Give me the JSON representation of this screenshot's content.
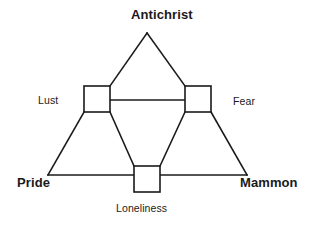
{
  "diagram": {
    "title_text": "Antichrist",
    "type": "triangle-node-diagram",
    "stroke_color": "#1a1a1a",
    "fill_color": "#ffffff",
    "background_color": "#ffffff",
    "vertex_labels": {
      "top": "Antichrist",
      "bottom_left": "Pride",
      "bottom_right": "Mammon"
    },
    "node_labels": {
      "left": "Lust",
      "right": "Fear",
      "bottom": "Loneliness"
    },
    "labels": [
      {
        "id": "antichrist",
        "text": "Antichrist",
        "weight": "bold",
        "position": "top-vertex"
      },
      {
        "id": "lust",
        "text": "Lust",
        "weight": "regular",
        "position": "left-node"
      },
      {
        "id": "fear",
        "text": "Fear",
        "weight": "regular",
        "position": "right-node"
      },
      {
        "id": "pride",
        "text": "Pride",
        "weight": "bold",
        "position": "bottom-left-vertex"
      },
      {
        "id": "mammon",
        "text": "Mammon",
        "weight": "bold",
        "position": "bottom-right-vertex"
      },
      {
        "id": "loneliness",
        "text": "Loneliness",
        "weight": "regular",
        "position": "bottom-node"
      }
    ],
    "nodes": [
      {
        "id": "left-node",
        "label": "Lust",
        "x": 84,
        "y": 86,
        "w": 26,
        "h": 26
      },
      {
        "id": "right-node",
        "label": "Fear",
        "x": 185,
        "y": 86,
        "w": 26,
        "h": 26
      },
      {
        "id": "bottom-node",
        "label": "Loneliness",
        "x": 134,
        "y": 166,
        "w": 26,
        "h": 26
      }
    ],
    "vertices": {
      "apex": {
        "x": 147,
        "y": 33
      },
      "bottom_left": {
        "x": 48,
        "y": 175
      },
      "bottom_right": {
        "x": 247,
        "y": 175
      }
    }
  }
}
